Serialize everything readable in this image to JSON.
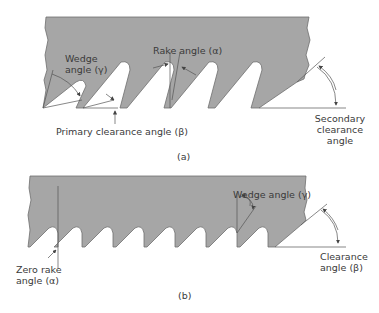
{
  "diagram": {
    "colors": {
      "blade_fill": "#a6a6a6",
      "blade_edge": "#6e6e6e",
      "line": "#555555",
      "text": "#3a3a3a"
    },
    "panel_a": {
      "caption": "(a)",
      "labels": {
        "wedge_line1": "Wedge",
        "wedge_line2": "angle (γ)",
        "rake": "Rake angle (α)",
        "primary_clearance": "Primary clearance angle (β)",
        "secondary_line1": "Secondary",
        "secondary_line2": "clearance",
        "secondary_line3": "angle"
      }
    },
    "panel_b": {
      "caption": "(b)",
      "labels": {
        "zero_rake_line1": "Zero rake",
        "zero_rake_line2": "angle (α)",
        "wedge": "Wedge angle (γ)",
        "clearance_line1": "Clearance",
        "clearance_line2": "angle (β)"
      }
    }
  }
}
